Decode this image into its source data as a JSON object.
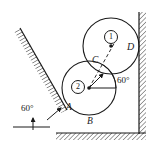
{
  "figure": {
    "type": "engineering-statics-diagram",
    "width": 159,
    "height": 152,
    "stroke_color": "#1a1a1a",
    "background_color": "#ffffff",
    "hatch_color": "#2b2b2b"
  },
  "bodies": {
    "cylinder1": {
      "badge": "1",
      "badge_x": 104,
      "badge_y": 30,
      "center_x": 111,
      "center_y": 46,
      "radius": 28,
      "side_label": "D",
      "side_label_x": 127,
      "side_label_y": 42
    },
    "cylinder2": {
      "badge": "2",
      "badge_x": 71,
      "badge_y": 80,
      "center_x": 89,
      "center_y": 88,
      "radius": 27
    }
  },
  "contact_points": [
    {
      "label": "C",
      "x": 94,
      "y": 61,
      "desc": "contact between cylinder 1 and cylinder 2"
    },
    {
      "label": "A",
      "x": 67,
      "y": 105,
      "desc": "contact between cylinder 2 and inclined wall"
    },
    {
      "label": "B",
      "x": 89,
      "y": 119,
      "desc": "contact between cylinder 2 and ground"
    }
  ],
  "angles": [
    {
      "label": "60°",
      "x": 22,
      "y": 105,
      "desc": "incline angle with horizontal ground"
    },
    {
      "label": "60°",
      "x": 117,
      "y": 77,
      "desc": "angle of center line with horizontal at cylinder 2"
    }
  ],
  "walls": {
    "incline": {
      "x1": 20,
      "y1": 28,
      "x2": 67,
      "y2": 110,
      "hatched_side": "upper-left"
    },
    "vertical_right": {
      "x": 139,
      "y1": 12,
      "y2": 133,
      "hatched_side": "right"
    },
    "ground": {
      "y": 133,
      "x1": 55,
      "x2": 139,
      "hatched_side": "below"
    },
    "reference_ground": {
      "x1": 13,
      "y1": 127,
      "x2": 50,
      "y2": 127
    }
  }
}
